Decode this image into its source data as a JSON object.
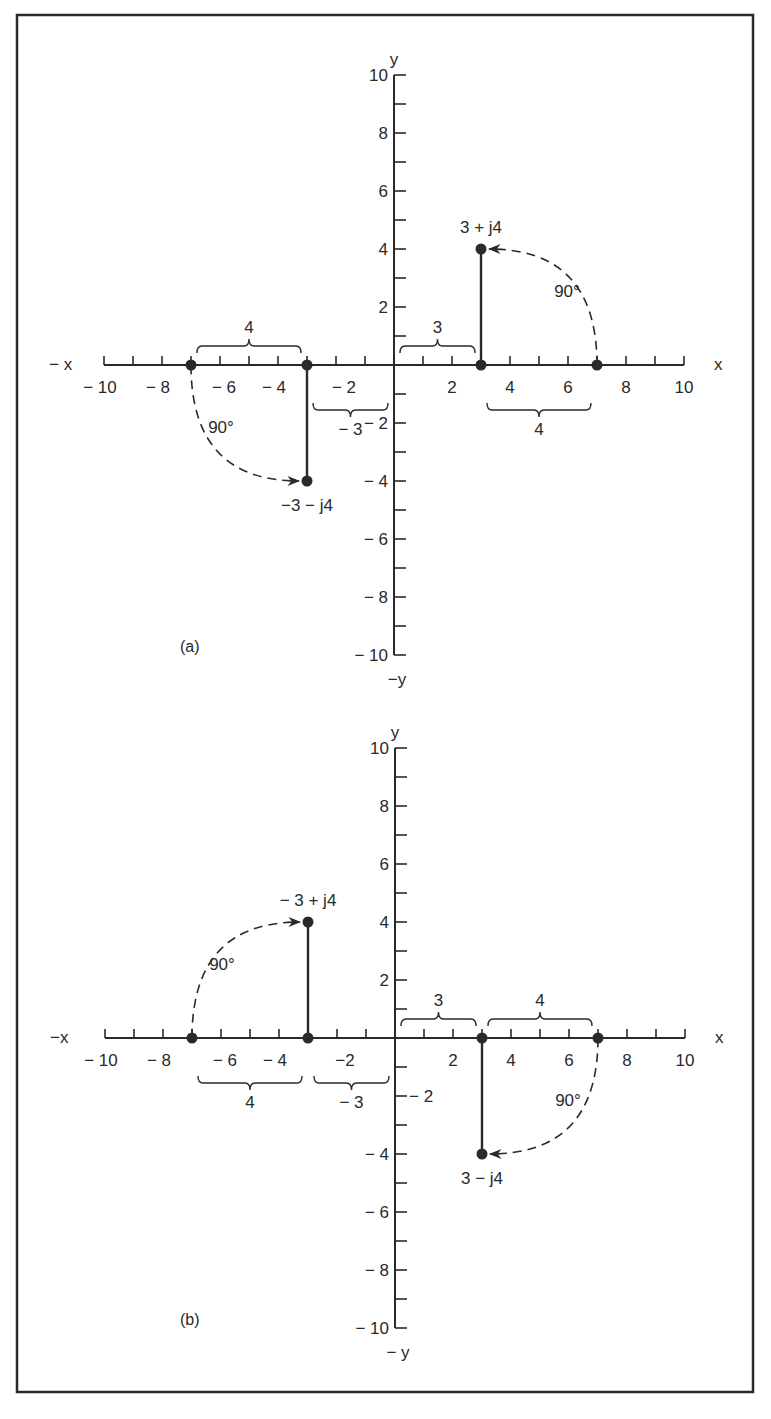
{
  "figure": {
    "panels": [
      {
        "id": "a",
        "label": "(a)",
        "origin_px": [
          394,
          365
        ],
        "unit_px": 29,
        "axis_labels": {
          "pos_x": "x",
          "neg_x": "− x",
          "pos_y": "y",
          "neg_y": "−y"
        },
        "x_ticks": [
          "− 10",
          "− 8",
          "− 6",
          "− 4",
          "− 2",
          "2",
          "4",
          "6",
          "8",
          "10"
        ],
        "y_ticks": [
          "10",
          "8",
          "6",
          "4",
          "2",
          "− 2",
          "− 4",
          "− 6",
          "− 8",
          "− 10"
        ],
        "points": [
          {
            "label": "3 + j4",
            "x": 3,
            "y": 4
          },
          {
            "label": "−3 − j4",
            "x": -3,
            "y": -4
          }
        ],
        "braces": [
          {
            "text": "4",
            "from": -7,
            "to": -3,
            "side": "above"
          },
          {
            "text": "3",
            "from": 0,
            "to": 3,
            "side": "above"
          },
          {
            "text": "4",
            "from": 3,
            "to": 7,
            "side": "below"
          },
          {
            "text": "− 3",
            "from": -3,
            "to": 0,
            "side": "below"
          }
        ],
        "angle_labels": [
          "90°",
          "90°"
        ],
        "extra_label": "− 2"
      },
      {
        "id": "b",
        "label": "(b)",
        "origin_px": [
          395,
          1038
        ],
        "unit_px": 29,
        "axis_labels": {
          "pos_x": "x",
          "neg_x": "−x",
          "pos_y": "y",
          "neg_y": "− y"
        },
        "x_ticks": [
          "− 10",
          "− 8",
          "− 6",
          "− 4",
          "−2",
          "2",
          "4",
          "6",
          "8",
          "10"
        ],
        "y_ticks": [
          "10",
          "8",
          "6",
          "4",
          "2",
          "− 2",
          "− 4",
          "− 6",
          "− 8",
          "− 10"
        ],
        "points": [
          {
            "label": "− 3 + j4",
            "x": -3,
            "y": 4
          },
          {
            "label": "3 − j4",
            "x": 3,
            "y": -4
          }
        ],
        "braces": [
          {
            "text": "3",
            "from": 0,
            "to": 3,
            "side": "above"
          },
          {
            "text": "4",
            "from": 3,
            "to": 7,
            "side": "above"
          },
          {
            "text": "4",
            "from": -7,
            "to": -3,
            "side": "below"
          },
          {
            "text": "− 3",
            "from": -3,
            "to": 0,
            "side": "below"
          }
        ],
        "angle_labels": [
          "90°",
          "90°"
        ]
      }
    ]
  }
}
